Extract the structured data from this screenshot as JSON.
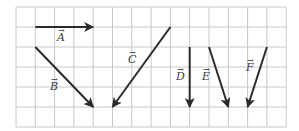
{
  "diagram": {
    "type": "vector-grid",
    "grid": {
      "x0": 16,
      "y0": 7,
      "cell_w": 19.3,
      "cell_h": 20,
      "cols": 14,
      "rows": 6,
      "line_color": "#c8c8c8"
    },
    "vector_color": "#2b2b2b",
    "vectors": [
      {
        "name": "A",
        "label": "A",
        "from": [
          1,
          1
        ],
        "to": [
          4,
          1
        ],
        "label_pos": [
          57,
          41
        ]
      },
      {
        "name": "B",
        "label": "B",
        "from": [
          1,
          2
        ],
        "to": [
          4,
          5
        ],
        "label_pos": [
          50,
          90
        ]
      },
      {
        "name": "C",
        "label": "C",
        "from": [
          8,
          1
        ],
        "to": [
          5,
          5
        ],
        "label_pos": [
          128,
          63
        ]
      },
      {
        "name": "D",
        "label": "D",
        "from": [
          9,
          2
        ],
        "to": [
          9,
          5
        ],
        "label_pos": [
          176,
          80
        ]
      },
      {
        "name": "E",
        "label": "E",
        "from": [
          10,
          2
        ],
        "to": [
          11,
          5
        ],
        "label_pos": [
          202,
          80
        ]
      },
      {
        "name": "F",
        "label": "F",
        "from": [
          13,
          2
        ],
        "to": [
          12,
          5
        ],
        "label_pos": [
          246,
          71
        ]
      }
    ]
  }
}
